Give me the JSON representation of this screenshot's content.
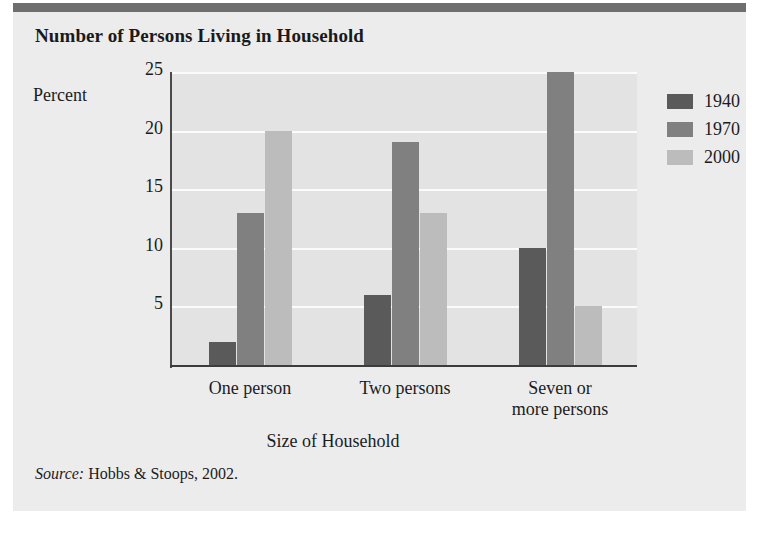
{
  "figure": {
    "title": "Number of Persons Living in Household",
    "source_label": "Source:",
    "source_text": "Hobbs & Stoops, 2002."
  },
  "colors": {
    "page_background": "#ffffff",
    "card_background": "#ececed",
    "top_rule": "#6e6e6e",
    "plot_background": "#e3e3e4",
    "gridline": "#fbfbfb",
    "axis": "#3c3c3c",
    "series_1940": "#5a5a5a",
    "series_1970": "#808080",
    "series_2000": "#bcbcbc",
    "text": "#1c1c1c"
  },
  "chart_data": {
    "type": "bar",
    "title": "Number of Persons Living in Household",
    "xlabel": "Size of Household",
    "ylabel": "Percent",
    "ylim": [
      0,
      25
    ],
    "yticks": [
      5,
      10,
      15,
      20,
      25
    ],
    "ytick_labels": [
      "5",
      "10",
      "15",
      "20",
      "25"
    ],
    "grid": true,
    "legend_position": "right",
    "categories": [
      "One person",
      "Two persons",
      "Seven or more persons"
    ],
    "category_lines": [
      [
        "One person"
      ],
      [
        "Two persons"
      ],
      [
        "Seven or",
        "more persons"
      ]
    ],
    "series": [
      {
        "name": "1940",
        "color": "#5a5a5a",
        "values": [
          2,
          6,
          10
        ]
      },
      {
        "name": "1970",
        "color": "#808080",
        "values": [
          13,
          19,
          25
        ]
      },
      {
        "name": "2000",
        "color": "#bcbcbc",
        "values": [
          20,
          13,
          5
        ]
      }
    ]
  }
}
